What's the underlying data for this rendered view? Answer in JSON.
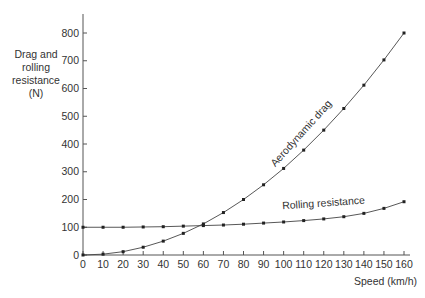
{
  "chart_data": {
    "type": "line",
    "title": "",
    "xlabel": "Speed (km/h)",
    "ylabel": "Drag and rolling resistance (N)",
    "ylabel_lines": [
      "Drag and",
      "rolling",
      "resistance",
      "(N)"
    ],
    "xlim": [
      0,
      160
    ],
    "ylim": [
      0,
      800
    ],
    "grid": false,
    "legend": "inline labels on curves",
    "x_ticks": [
      0,
      10,
      20,
      30,
      40,
      50,
      60,
      70,
      80,
      90,
      100,
      110,
      120,
      130,
      140,
      150,
      160
    ],
    "y_ticks": [
      0,
      100,
      200,
      300,
      400,
      500,
      600,
      700,
      800
    ],
    "x": [
      0,
      10,
      20,
      30,
      40,
      50,
      60,
      70,
      80,
      90,
      100,
      110,
      120,
      130,
      140,
      150,
      160
    ],
    "series": [
      {
        "name": "Aerodynamic drag",
        "values": [
          0,
          3,
          12,
          28,
          50,
          78,
          112,
          153,
          200,
          253,
          312,
          378,
          450,
          528,
          612,
          703,
          800
        ]
      },
      {
        "name": "Rolling resistance",
        "values": [
          100,
          100,
          100,
          101,
          102,
          104,
          106,
          108,
          111,
          115,
          119,
          124,
          130,
          138,
          150,
          168,
          192
        ]
      }
    ],
    "annotations": [
      {
        "text": "Aerodynamic drag",
        "near_x": 110,
        "near_y": 430,
        "rotation_deg": -48
      },
      {
        "text": "Rolling resistance",
        "near_x": 120,
        "near_y": 175,
        "rotation_deg": -4
      }
    ]
  }
}
